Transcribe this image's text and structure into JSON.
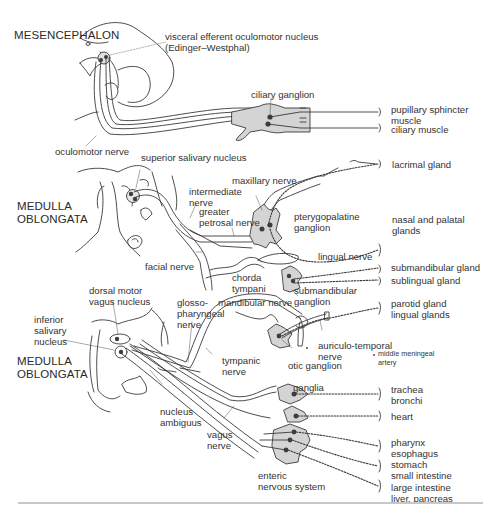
{
  "regions": {
    "mesencephalon": "MESENCEPHALON",
    "medulla_upper": [
      "MEDULLA",
      "OBLONGATA"
    ],
    "medulla_lower": [
      "MEDULLA",
      "OBLONGATA"
    ]
  },
  "nuclei": {
    "edinger_westphal": [
      "visceral efferent oculomotor nucleus",
      "(Edinger–Westphal)"
    ],
    "superior_salivary": "superior salivary nucleus",
    "dorsal_motor_vagus": [
      "dorsal motor",
      "vagus nucleus"
    ],
    "inferior_salivary": [
      "inferior",
      "salivary",
      "nucleus"
    ],
    "nucleus_ambiguus": [
      "nucleus",
      "ambiguus"
    ]
  },
  "nerves": {
    "oculomotor": "oculomotor nerve",
    "intermediate": [
      "intermediate",
      "nerve"
    ],
    "greater_petrosal": [
      "greater",
      "petrosal nerve"
    ],
    "maxillary": "maxillary nerve",
    "facial": "facial nerve",
    "chorda_tympani": [
      "chorda",
      "tympani"
    ],
    "lingual": "lingual nerve",
    "glossopharyngeal": [
      "glosso-",
      "pharyngeal",
      "nerve"
    ],
    "mandibular": "mandibular nerve",
    "tympanic": [
      "tympanic",
      "nerve"
    ],
    "auriculotemporal": [
      "auriculo-temporal",
      "nerve"
    ],
    "vagus": [
      "vagus",
      "nerve"
    ]
  },
  "ganglia": {
    "ciliary": "ciliary ganglion",
    "pterygopalatine": [
      "pterygopalatine",
      "ganglion"
    ],
    "submandibular": [
      "submandibular",
      "ganglion"
    ],
    "otic": "otic ganglion",
    "ganglia": "ganglia",
    "enteric": [
      "enteric",
      "nervous system"
    ]
  },
  "annotations": {
    "middle_meningeal_artery": [
      "middle meningeal",
      "artery"
    ]
  },
  "targets": [
    {
      "id": "pupillary",
      "lines": [
        "pupillary sphincter",
        "muscle"
      ]
    },
    {
      "id": "ciliary_muscle",
      "lines": [
        "ciliary muscle"
      ]
    },
    {
      "id": "lacrimal",
      "lines": [
        "lacrimal gland"
      ]
    },
    {
      "id": "nasal_palatal",
      "lines": [
        "nasal and palatal",
        "glands"
      ]
    },
    {
      "id": "submandibular_gland",
      "lines": [
        "submandibular gland"
      ]
    },
    {
      "id": "sublingual_gland",
      "lines": [
        "sublingual gland"
      ]
    },
    {
      "id": "parotid_lingual",
      "lines": [
        "parotid gland",
        "lingual glands"
      ]
    },
    {
      "id": "trachea_bronchi",
      "lines": [
        "trachea",
        "bronchi"
      ]
    },
    {
      "id": "heart",
      "lines": [
        "heart"
      ]
    },
    {
      "id": "pharynx_esophagus",
      "lines": [
        "pharynx",
        "esophagus"
      ]
    },
    {
      "id": "stomach_si",
      "lines": [
        "stomach",
        "small intestine"
      ]
    },
    {
      "id": "li_liver_pancreas",
      "lines": [
        "large intestine",
        "liver, pancreas"
      ]
    }
  ],
  "colors": {
    "line": "#3a3a3a",
    "ganglion_fill": "#d4d4d4",
    "nucleus_dot": "#3d3d3d",
    "text": "#333333"
  }
}
